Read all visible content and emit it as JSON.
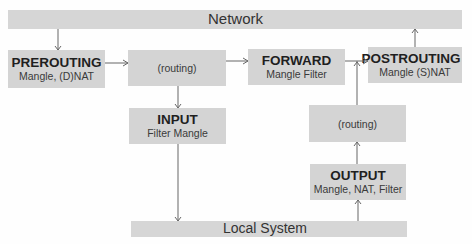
{
  "diagram": {
    "bars": {
      "network": {
        "label": "Network"
      },
      "local_system": {
        "label": "Local System"
      }
    },
    "boxes": {
      "prerouting": {
        "title": "PREROUTING",
        "subtitle": "Mangle, (D)NAT"
      },
      "routing_1": {
        "label": "(routing)"
      },
      "forward": {
        "title": "FORWARD",
        "subtitle": "Mangle Filter"
      },
      "postrouting": {
        "title": "POSTROUTING",
        "subtitle": "Mangle (S)NAT"
      },
      "input": {
        "title": "INPUT",
        "subtitle": "Filter Mangle"
      },
      "routing_2": {
        "label": "(routing)"
      },
      "output": {
        "title": "OUTPUT",
        "subtitle": "Mangle, NAT, Filter"
      }
    },
    "edges": [
      {
        "from": "Network",
        "to": "PREROUTING"
      },
      {
        "from": "PREROUTING",
        "to": "(routing)"
      },
      {
        "from": "(routing)",
        "to": "FORWARD"
      },
      {
        "from": "(routing)",
        "to": "INPUT"
      },
      {
        "from": "FORWARD",
        "to": "POSTROUTING"
      },
      {
        "from": "POSTROUTING",
        "to": "Network"
      },
      {
        "from": "INPUT",
        "to": "Local System"
      },
      {
        "from": "Local System",
        "to": "OUTPUT"
      },
      {
        "from": "OUTPUT",
        "to": "(routing) 2"
      },
      {
        "from": "(routing) 2",
        "to": "POSTROUTING"
      }
    ],
    "colors": {
      "box_fill": "#d4d4d4",
      "bar_fill": "#d6d6d6",
      "line": "#666666"
    }
  }
}
